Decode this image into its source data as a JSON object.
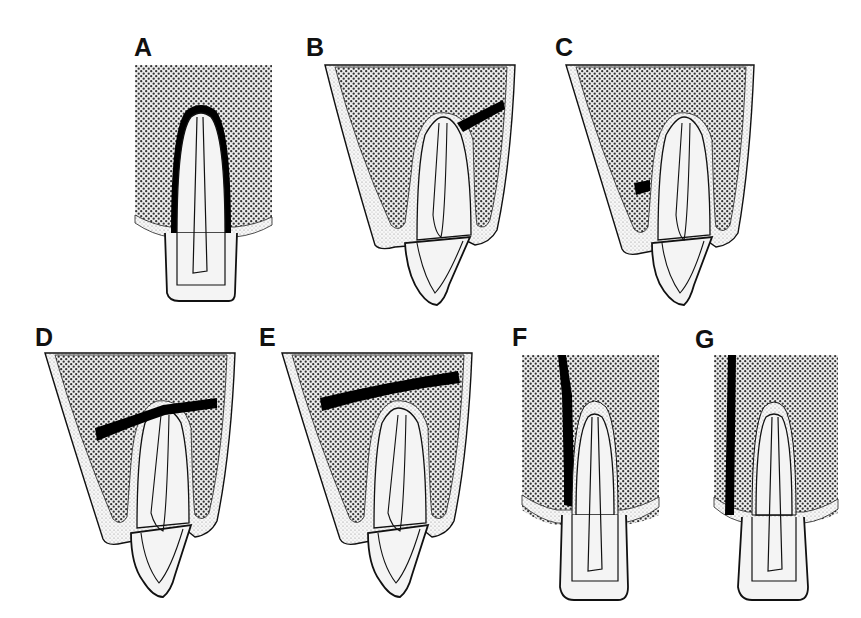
{
  "figure": {
    "colors": {
      "bone_dots": "#3a3a3a",
      "bone_bg": "#f2f2f2",
      "tooth_fill": "#f4f4f4",
      "outline": "#111111",
      "fracture": "#000000",
      "periosteum_dots": "#9a9a9a"
    },
    "panels": [
      {
        "label": "A",
        "type": "straight-rect-bone",
        "fracture": "periradicular-dark-halo"
      },
      {
        "label": "B",
        "type": "tapered-bone-extruded-tooth",
        "fracture": "oblique-upper-right-from-apex"
      },
      {
        "label": "C",
        "type": "tapered-bone-extruded-tooth",
        "fracture": "short-lower-left-wall"
      },
      {
        "label": "D",
        "type": "tapered-bone-extruded-tooth",
        "fracture": "horizontal-through-apex"
      },
      {
        "label": "E",
        "type": "tapered-bone-extruded-tooth",
        "fracture": "horizontal-above-apex"
      },
      {
        "label": "F",
        "type": "straight-rect-bone",
        "fracture": "vertical-adjacent-to-root"
      },
      {
        "label": "G",
        "type": "straight-rect-bone",
        "fracture": "vertical-distant-from-root"
      }
    ]
  }
}
